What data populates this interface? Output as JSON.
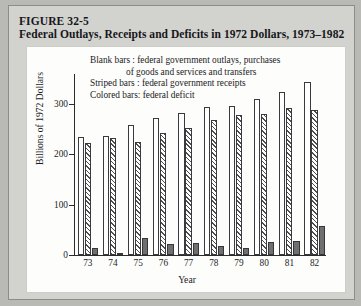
{
  "figure": {
    "number": "FIGURE 32-5",
    "title": "Federal Outlays, Receipts and Deficits in 1972 Dollars, 1973–1982"
  },
  "legend": {
    "blank_key": "Blank bars :",
    "blank_text": "federal government outlays, purchases",
    "blank_text_cont": "of goods and services and transfers",
    "striped_key": "Striped bars :",
    "striped_text": "federal government receipts",
    "colored_key": "Colored bars:",
    "colored_text": "federal deficit"
  },
  "chart_data": {
    "type": "bar",
    "title": "Federal Outlays, Receipts and Deficits in 1972 Dollars, 1973–1982",
    "xlabel": "Year",
    "ylabel": "Billions of 1972 Dollars",
    "categories": [
      "73",
      "74",
      "75",
      "76",
      "77",
      "78",
      "79",
      "80",
      "81",
      "82"
    ],
    "yticks": [
      0,
      100,
      200,
      300
    ],
    "ylim": [
      0,
      360
    ],
    "grid": false,
    "legend_position": "top",
    "series": [
      {
        "name": "federal government outlays, purchases of goods and services and transfers",
        "style": "blank",
        "values": [
          235,
          236,
          258,
          272,
          283,
          295,
          296,
          311,
          325,
          345
        ]
      },
      {
        "name": "federal government receipts",
        "style": "striped",
        "values": [
          222,
          232,
          224,
          243,
          253,
          268,
          278,
          281,
          292,
          288
        ]
      },
      {
        "name": "federal deficit",
        "style": "colored",
        "values": [
          14,
          4,
          34,
          22,
          24,
          18,
          14,
          26,
          27,
          58
        ]
      }
    ]
  }
}
